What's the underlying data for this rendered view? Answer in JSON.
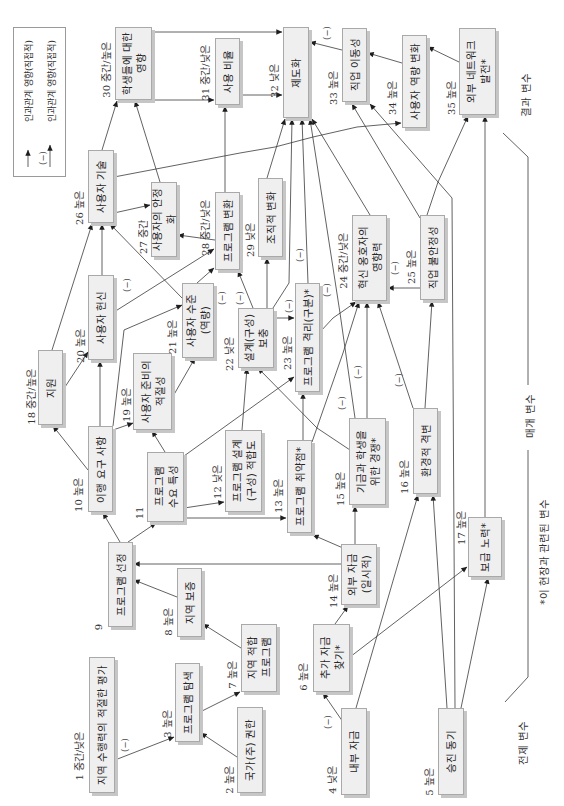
{
  "legend": {
    "items": [
      {
        "label": "인과관계 영향(직접적)",
        "sign": ""
      },
      {
        "label": "인과관계 영향(직접적)",
        "sign": "(−)"
      }
    ]
  },
  "groups": {
    "outcome": "결과 변수",
    "mediating": "매개 변수",
    "precondition": "전제 변수",
    "footnote": "*이 현장과 관련된 변수"
  },
  "sign_label": "(−)",
  "nodes": [
    {
      "id": 1,
      "label": "1 중간/낮은",
      "text": "지역 수행력의 적절한 평가"
    },
    {
      "id": 2,
      "label": "2 높은",
      "text": "국가(주) 권한"
    },
    {
      "id": 3,
      "label": "3 높은",
      "text": "프로그램 탐색"
    },
    {
      "id": 4,
      "label": "4 낮은",
      "text": "내부 자금"
    },
    {
      "id": 5,
      "label": "5 높은",
      "text": "승진 동기"
    },
    {
      "id": 6,
      "label": "6 높은",
      "text": "추가 자금\n찾기*"
    },
    {
      "id": 7,
      "label": "7 높은",
      "text": "지역 적합\n프로그램"
    },
    {
      "id": 8,
      "label": "8 높은",
      "text": "지역 보증"
    },
    {
      "id": 9,
      "label": "9",
      "text": "프로그램 선정"
    },
    {
      "id": 10,
      "label": "10 높은",
      "text": "이행 요구 사항"
    },
    {
      "id": 11,
      "label": "11",
      "text": "프로그램\n수요 특성"
    },
    {
      "id": 12,
      "label": "12 낮은",
      "text": "프로그램 설계\n(구성) 적합도"
    },
    {
      "id": 13,
      "label": "13 높은",
      "text": "프로그램 취약점*"
    },
    {
      "id": 14,
      "label": "14 높은",
      "text": "외부 자금\n(일시적)"
    },
    {
      "id": 15,
      "label": "15 높은",
      "text": "기금과 학생을\n위한 경쟁*"
    },
    {
      "id": 16,
      "label": "16 높은",
      "text": "환경적 격변"
    },
    {
      "id": 17,
      "label": "17 높은",
      "text": "보급 노력*"
    },
    {
      "id": 18,
      "label": "18 중간/높은",
      "text": "지원"
    },
    {
      "id": 19,
      "label": "19 높은",
      "text": "사용자 준비의\n적절성"
    },
    {
      "id": 20,
      "label": "20 높은",
      "text": "사용자 헌신"
    },
    {
      "id": 21,
      "label": "21 높은",
      "text": "사용자 수준\n(역량)"
    },
    {
      "id": 22,
      "label": "22 낮은",
      "text": "설계(구성)\n보충"
    },
    {
      "id": 23,
      "label": "23 높은",
      "text": "프로그램 격리(구분)*"
    },
    {
      "id": 24,
      "label": "24 중간/낮은",
      "text": "혁신 옹호자의\n영향력"
    },
    {
      "id": 25,
      "label": "25 높은",
      "text": "직업 불안정성"
    },
    {
      "id": 26,
      "label": "26 높은",
      "text": "사용자 기술"
    },
    {
      "id": 27,
      "label": "27 중간",
      "text": "사용자의 안정화"
    },
    {
      "id": 28,
      "label": "28 중간/낮은",
      "text": "프로그램 변환"
    },
    {
      "id": 29,
      "label": "29 낮은",
      "text": "조직적 변화"
    },
    {
      "id": 30,
      "label": "30 중간/높은",
      "text": "학생들에 대한\n영향"
    },
    {
      "id": 31,
      "label": "31 중간/낮은",
      "text": "사용 비율"
    },
    {
      "id": 32,
      "label": "32 낮은",
      "text": "제도화"
    },
    {
      "id": 33,
      "label": "33 높은",
      "text": "직업 이동성"
    },
    {
      "id": 34,
      "label": "34 높은",
      "text": "사용자 역량 변화"
    },
    {
      "id": 35,
      "label": "35 높은",
      "text": "외부 네트워크\n발전*"
    }
  ],
  "edges": [
    {
      "from": 1,
      "to": 3,
      "sign": "-"
    },
    {
      "from": 2,
      "to": 3,
      "sign": "+"
    },
    {
      "from": 3,
      "to": 7,
      "sign": "+"
    },
    {
      "from": 7,
      "to": 8,
      "sign": "+"
    },
    {
      "from": 8,
      "to": 9,
      "sign": "+"
    },
    {
      "from": 9,
      "to": 10,
      "sign": "+"
    },
    {
      "from": 9,
      "to": 11,
      "sign": "+"
    },
    {
      "from": 14,
      "to": 9,
      "sign": "+"
    },
    {
      "from": 4,
      "to": 6,
      "sign": "-"
    },
    {
      "from": 6,
      "to": 14,
      "sign": "+"
    },
    {
      "from": 6,
      "to": 17,
      "sign": "+"
    },
    {
      "from": 4,
      "to": 16,
      "sign": "+"
    },
    {
      "from": 5,
      "to": 16,
      "sign": "+"
    },
    {
      "from": 5,
      "to": 17,
      "sign": "+"
    },
    {
      "from": 5,
      "to": 33,
      "sign": "+"
    },
    {
      "from": 17,
      "to": 35,
      "sign": "+"
    },
    {
      "from": 14,
      "to": 13,
      "sign": "+"
    },
    {
      "from": 14,
      "to": 15,
      "sign": "+"
    },
    {
      "from": 11,
      "to": 12,
      "sign": "+"
    },
    {
      "from": 11,
      "to": 13,
      "sign": "+"
    },
    {
      "from": 11,
      "to": 19,
      "sign": "+"
    },
    {
      "from": 11,
      "to": 23,
      "sign": "+"
    },
    {
      "from": 10,
      "to": 18,
      "sign": "+"
    },
    {
      "from": 10,
      "to": 20,
      "sign": "+"
    },
    {
      "from": 10,
      "to": 19,
      "sign": "+"
    },
    {
      "from": 10,
      "to": 21,
      "sign": "+"
    },
    {
      "from": 18,
      "to": 20,
      "sign": "+"
    },
    {
      "from": 18,
      "to": 26,
      "sign": "+"
    },
    {
      "from": 19,
      "to": 21,
      "sign": "+"
    },
    {
      "from": 20,
      "to": 26,
      "sign": "+"
    },
    {
      "from": 20,
      "to": 28,
      "sign": "+"
    },
    {
      "from": 21,
      "to": 28,
      "sign": "-"
    },
    {
      "from": 21,
      "to": 26,
      "sign": "-"
    },
    {
      "from": 12,
      "to": 22,
      "sign": "+"
    },
    {
      "from": 13,
      "to": 23,
      "sign": "+"
    },
    {
      "from": 13,
      "to": 24,
      "sign": "-"
    },
    {
      "from": 15,
      "to": 22,
      "sign": "+"
    },
    {
      "from": 15,
      "to": 24,
      "sign": "+"
    },
    {
      "from": 15,
      "to": 32,
      "sign": "-"
    },
    {
      "from": 16,
      "to": 24,
      "sign": "-"
    },
    {
      "from": 16,
      "to": 25,
      "sign": "+"
    },
    {
      "from": 22,
      "to": 23,
      "sign": "-"
    },
    {
      "from": 22,
      "to": 28,
      "sign": "-"
    },
    {
      "from": 22,
      "to": 29,
      "sign": "+"
    },
    {
      "from": 22,
      "to": 32,
      "sign": "-"
    },
    {
      "from": 23,
      "to": 32,
      "sign": "-"
    },
    {
      "from": 23,
      "to": 24,
      "sign": "+"
    },
    {
      "from": 24,
      "to": 32,
      "sign": "+"
    },
    {
      "from": 25,
      "to": 24,
      "sign": "-"
    },
    {
      "from": 25,
      "to": 33,
      "sign": "+"
    },
    {
      "from": 25,
      "to": 35,
      "sign": "+"
    },
    {
      "from": 26,
      "to": 27,
      "sign": "+"
    },
    {
      "from": 26,
      "to": 30,
      "sign": "+"
    },
    {
      "from": 26,
      "to": 34,
      "sign": "+"
    },
    {
      "from": 27,
      "to": 30,
      "sign": "+"
    },
    {
      "from": 28,
      "to": 27,
      "sign": "+"
    },
    {
      "from": 28,
      "to": 31,
      "sign": "+"
    },
    {
      "from": 29,
      "to": 32,
      "sign": "+"
    },
    {
      "from": 30,
      "to": 31,
      "sign": "+"
    },
    {
      "from": 30,
      "to": 32,
      "sign": "+"
    },
    {
      "from": 31,
      "to": 32,
      "sign": "+"
    },
    {
      "from": 33,
      "to": 32,
      "sign": "-"
    },
    {
      "from": 34,
      "to": 33,
      "sign": "+"
    },
    {
      "from": 35,
      "to": 34,
      "sign": "+"
    }
  ]
}
